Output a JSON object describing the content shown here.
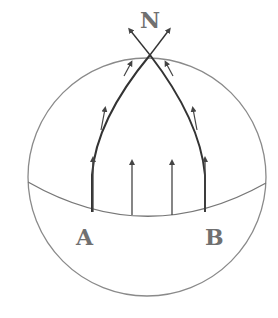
{
  "diagram": {
    "title_label": "N",
    "point_a_label": "A",
    "point_b_label": "B",
    "colors": {
      "outline": "#8a8a8a",
      "arrow": "#444444",
      "label": "#707070"
    }
  }
}
